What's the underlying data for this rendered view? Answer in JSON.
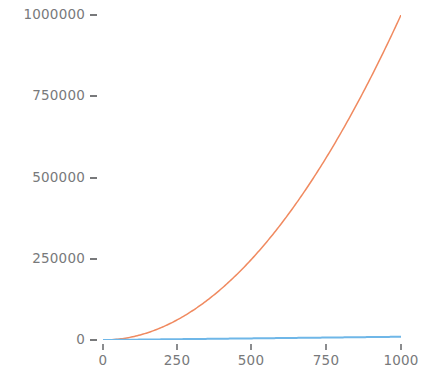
{
  "chart_data": {
    "type": "line",
    "title": "",
    "subtitle": "",
    "xlabel": "",
    "ylabel": "",
    "xlim": [
      0,
      1000
    ],
    "ylim": [
      0,
      1000000
    ],
    "grid": false,
    "legend": null,
    "background_color": "#ffffff",
    "tick_label_color": "#78797b",
    "x": [
      0,
      100,
      200,
      300,
      400,
      500,
      600,
      700,
      800,
      900,
      1000
    ],
    "xticks": [
      0,
      250,
      500,
      750,
      1000
    ],
    "xtick_labels": [
      "0",
      "250",
      "500",
      "750",
      "1000"
    ],
    "yticks": [
      0,
      250000,
      500000,
      750000,
      1000000
    ],
    "ytick_labels": [
      "0",
      "250000",
      "500000",
      "750000",
      "1000000"
    ],
    "series": [
      {
        "name": "quadratic",
        "color": "#f08a60",
        "linewidth": 1.5,
        "values": [
          0,
          10000,
          40000,
          90000,
          160000,
          250000,
          360000,
          490000,
          640000,
          810000,
          1000000
        ]
      },
      {
        "name": "linear",
        "color": "#6fb7e8",
        "linewidth": 2,
        "values": [
          0,
          1000,
          2000,
          3000,
          4000,
          5000,
          6000,
          7000,
          8000,
          9000,
          10000
        ]
      }
    ]
  }
}
